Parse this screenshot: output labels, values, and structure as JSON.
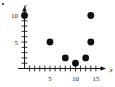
{
  "chart_data": {
    "type": "scatter",
    "title": "",
    "xlabel": "x",
    "ylabel": "y",
    "xlim": [
      0,
      17
    ],
    "ylim": [
      0,
      11.5
    ],
    "grid": false,
    "legend": null,
    "x_tick_labels": [
      "5",
      "10",
      "15"
    ],
    "x_tick_values": [
      5,
      10,
      15
    ],
    "y_tick_labels": [
      "5",
      "10"
    ],
    "y_tick_values": [
      5,
      10
    ],
    "x_minor_tick_step": 1,
    "y_minor_tick_step": 1,
    "marker_color": "#111111",
    "axis_color": "#1a1a1a",
    "points": [
      {
        "x": 0,
        "y": 10
      },
      {
        "x": 5,
        "y": 5
      },
      {
        "x": 8,
        "y": 2
      },
      {
        "x": 10,
        "y": 1
      },
      {
        "x": 12,
        "y": 2
      },
      {
        "x": 13,
        "y": 5
      },
      {
        "x": 13,
        "y": 10
      }
    ]
  },
  "axis_labels": {
    "x": "x",
    "y": "y"
  },
  "tick_labels": {
    "x5": "5",
    "x10": "10",
    "x15": "15",
    "y5": "5",
    "y10": "10"
  }
}
